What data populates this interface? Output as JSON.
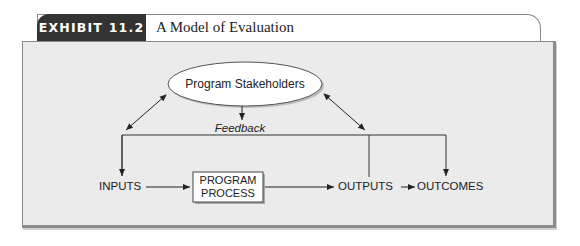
{
  "header": {
    "exhibit_label": "EXHIBIT 11.2",
    "title": "A Model of Evaluation"
  },
  "diagram": {
    "stakeholders": "Program Stakeholders",
    "feedback": "Feedback",
    "inputs": "INPUTS",
    "process_line1": "PROGRAM",
    "process_line2": "PROCESS",
    "outputs": "OUTPUTS",
    "outcomes": "OUTCOMES"
  },
  "colors": {
    "tab_bg": "#333333",
    "panel_bg": "#ebebeb",
    "line": "#333333"
  }
}
